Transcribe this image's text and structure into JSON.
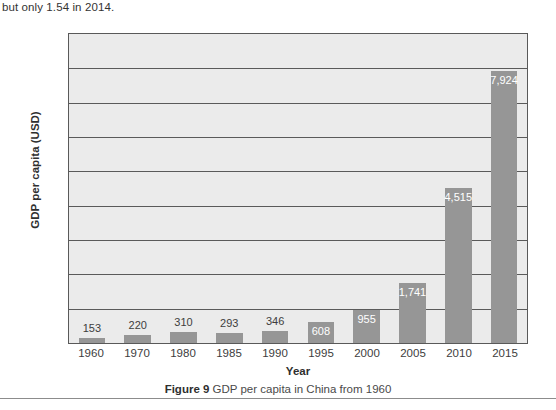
{
  "body_text": "but only 1.54 in 2014.",
  "figure": {
    "caption_label": "Figure 9",
    "caption_text": " GDP per capita in China from 1960"
  },
  "chart_data": {
    "type": "bar",
    "title": "",
    "xlabel": "Year",
    "ylabel": "GDP per capita (USD)",
    "categories": [
      "1960",
      "1970",
      "1980",
      "1985",
      "1990",
      "1995",
      "2000",
      "2005",
      "2010",
      "2015"
    ],
    "values": [
      153,
      220,
      310,
      293,
      346,
      608,
      955,
      1741,
      4515,
      7924
    ],
    "value_labels": [
      "153",
      "220",
      "310",
      "293",
      "346",
      "608",
      "955",
      "1,741",
      "4,515",
      "7,924"
    ],
    "label_placement": [
      "outside",
      "outside",
      "outside",
      "outside",
      "outside",
      "inside",
      "inside",
      "inside",
      "inside",
      "inside"
    ],
    "ylim": [
      0,
      9000
    ],
    "gridlines": 8,
    "grid": true,
    "legend": "none",
    "y_tick_labels": [],
    "bar_color": "#969696",
    "plot_background": "#ebebeb",
    "frame_color": "#595959"
  }
}
